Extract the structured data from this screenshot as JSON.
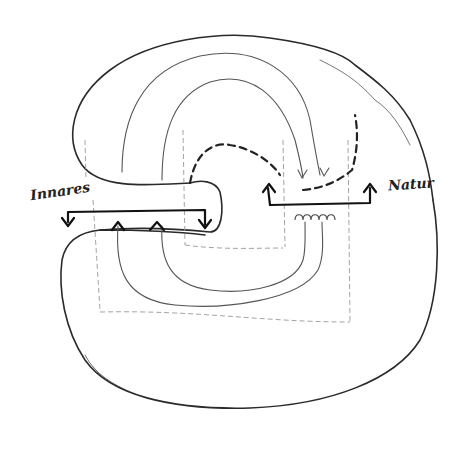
{
  "diagram": {
    "type": "hand-drawn sketch",
    "labels": {
      "left": "Innares",
      "right": "Natur"
    },
    "colors": {
      "background": "#ffffff",
      "stroke": "#2a2a2a",
      "faint": "#999999"
    }
  }
}
